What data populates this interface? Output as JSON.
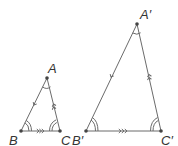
{
  "diagram": {
    "colors": {
      "line": "#6b6b6b",
      "point": "#444444",
      "label": "#333333"
    },
    "triangles": [
      {
        "id": "small",
        "vertices": [
          {
            "name": "A",
            "label": "A"
          },
          {
            "name": "B",
            "label": "B"
          },
          {
            "name": "C",
            "label": "C"
          }
        ]
      },
      {
        "id": "large",
        "vertices": [
          {
            "name": "A'",
            "label": "A′"
          },
          {
            "name": "B'",
            "label": "B′"
          },
          {
            "name": "C'",
            "label": "C′"
          }
        ]
      }
    ],
    "markings": {
      "angle_A": "single arc",
      "angles_B_C": "double arc",
      "side_AB": "single arrow",
      "side_AC": "double arrow",
      "side_BC": "triple arrow"
    }
  }
}
